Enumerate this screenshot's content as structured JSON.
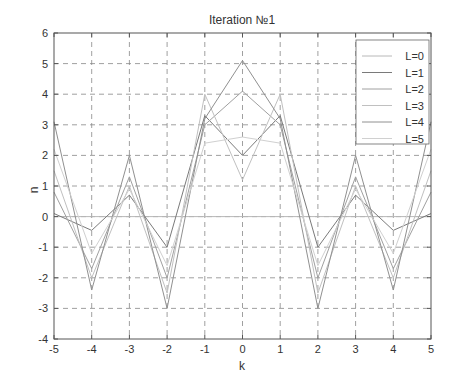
{
  "chart_data": {
    "type": "line",
    "title": "Iteration №1",
    "xlabel": "k",
    "ylabel": "n",
    "xlim": [
      -5,
      5
    ],
    "ylim": [
      -4,
      6
    ],
    "x": [
      -5,
      -4,
      -3,
      -2,
      -1,
      0,
      1,
      2,
      3,
      4,
      5
    ],
    "xticks": [
      "-5",
      "-4",
      "-3",
      "-2",
      "-1",
      "0",
      "1",
      "2",
      "3",
      "4",
      "5"
    ],
    "yticks": [
      "-4",
      "-3",
      "-2",
      "-1",
      "0",
      "1",
      "2",
      "3",
      "4",
      "5",
      "6"
    ],
    "grid": true,
    "legend_position": "top-right",
    "values_note": "Series values are approximate readings; assignment of values to individual L series is uncertain because lines are faint overlapping grays.",
    "series": [
      {
        "name": "L=0",
        "values": [
          0,
          0,
          0,
          0,
          0,
          0,
          0,
          0,
          0,
          0,
          0
        ],
        "color": "#b8b8b8"
      },
      {
        "name": "L=1",
        "values": [
          0.1,
          -0.45,
          0.7,
          -1.0,
          3.3,
          2.0,
          3.3,
          -1.0,
          0.7,
          -0.45,
          0.1
        ],
        "color": "#7a7a7a"
      },
      {
        "name": "L=2",
        "values": [
          0.8,
          -1.7,
          1.3,
          -2.0,
          3.0,
          4.1,
          3.0,
          -2.0,
          1.3,
          -1.7,
          0.8
        ],
        "color": "#a0a0a0"
      },
      {
        "name": "L=3",
        "values": [
          1.5,
          -2.0,
          1.0,
          -2.5,
          4.0,
          1.2,
          4.0,
          -2.5,
          1.0,
          -2.0,
          1.5
        ],
        "color": "#c0c0c0"
      },
      {
        "name": "L=4",
        "values": [
          3.1,
          -2.4,
          2.0,
          -3.0,
          3.2,
          5.1,
          3.2,
          -3.0,
          2.0,
          -2.4,
          3.1
        ],
        "color": "#909090"
      },
      {
        "name": "L=5",
        "values": [
          2.2,
          -1.2,
          0.9,
          -1.6,
          2.4,
          2.6,
          2.4,
          -1.6,
          0.9,
          -1.2,
          2.2
        ],
        "color": "#d0d0d0"
      }
    ]
  }
}
